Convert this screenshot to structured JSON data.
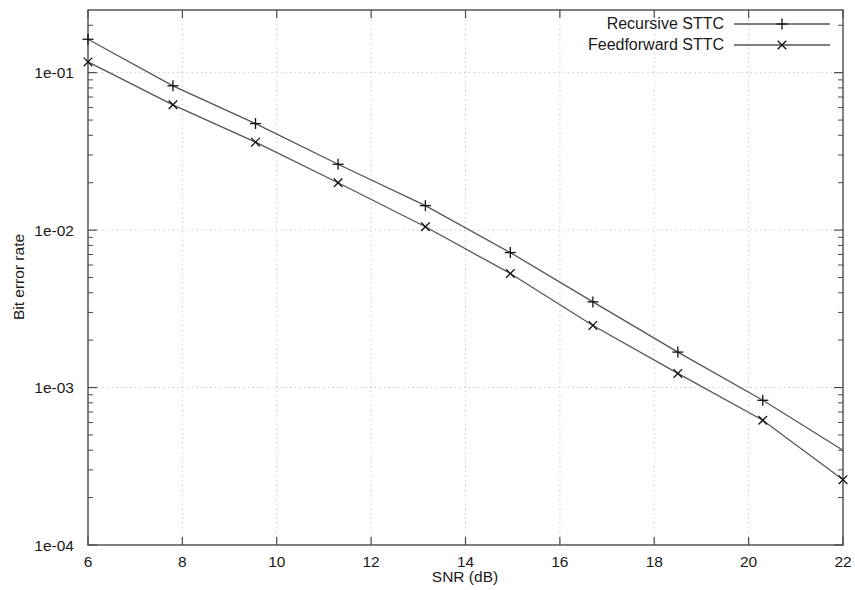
{
  "chart_data": {
    "type": "line",
    "title": "",
    "xlabel": "SNR (dB)",
    "ylabel": "Bit error rate",
    "xlim": [
      6,
      22
    ],
    "ylim": [
      0.0001,
      0.25
    ],
    "yscale": "log",
    "grid": true,
    "legend_position": "top-right",
    "xticks": [
      6,
      8,
      10,
      12,
      14,
      16,
      18,
      20,
      22
    ],
    "xtick_labels": [
      "6",
      "8",
      "10",
      "12",
      "14",
      "16",
      "18",
      "20",
      "22"
    ],
    "yticks": [
      0.1,
      0.01,
      0.001,
      0.0001
    ],
    "ytick_labels": [
      "1e-01",
      "1e-02",
      "1e-03",
      "1e-04"
    ],
    "series": [
      {
        "name": "Recursive STTC",
        "marker": "plus",
        "color": "#555555",
        "x": [
          6.0,
          7.8,
          9.55,
          11.3,
          13.15,
          14.95,
          16.7,
          18.5,
          20.3,
          22.0
        ],
        "y": [
          0.163,
          0.0825,
          0.0475,
          0.0262,
          0.0143,
          0.0072,
          0.0035,
          0.00168,
          0.00083,
          0.0004
        ]
      },
      {
        "name": "Feedforward STTC",
        "marker": "cross",
        "color": "#555555",
        "x": [
          6.0,
          7.8,
          9.55,
          11.3,
          13.15,
          14.95,
          16.7,
          18.5,
          20.3,
          22.0
        ],
        "y": [
          0.117,
          0.0625,
          0.0362,
          0.02,
          0.0105,
          0.0053,
          0.00248,
          0.00123,
          0.00062,
          0.00026
        ]
      }
    ]
  },
  "legend": {
    "entries": [
      {
        "label": "Recursive STTC",
        "marker": "plus"
      },
      {
        "label": "Feedforward STTC",
        "marker": "cross"
      }
    ]
  }
}
